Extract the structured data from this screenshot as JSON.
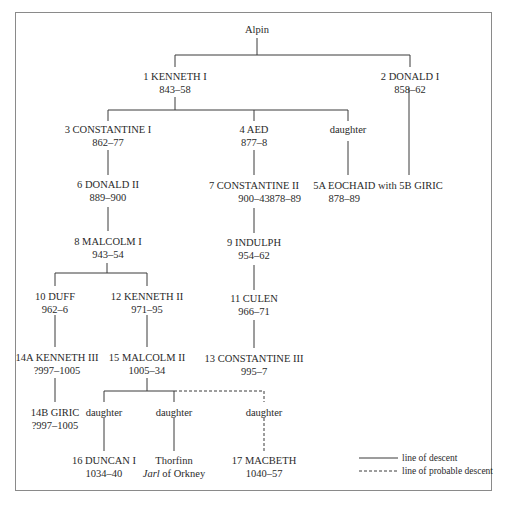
{
  "root": {
    "name": "Alpin"
  },
  "nodes": {
    "kenneth_i": {
      "name": "1 KENNETH I",
      "dates": "843–58"
    },
    "donald_i": {
      "name": "2 DONALD I",
      "dates": "858–62"
    },
    "constantine_i": {
      "name": "3 CONSTANTINE I",
      "dates": "862–77"
    },
    "aed": {
      "name": "4 AED",
      "dates": "877–8"
    },
    "daughter_kenneth": {
      "name": "daughter"
    },
    "donald_ii": {
      "name": "6 DONALD II",
      "dates": "889–900"
    },
    "constantine_ii": {
      "name": "7 CONSTANTINE II",
      "dates": "900–43"
    },
    "eochaid_giric": {
      "name": "5A EOCHAID with 5B GIRIC",
      "dates_eochaid": "878–89",
      "dates_giric": "878–89"
    },
    "malcolm_i": {
      "name": "8  MALCOLM I",
      "dates": "943–54"
    },
    "indulph": {
      "name": "9 INDULPH",
      "dates": "954–62"
    },
    "duff": {
      "name": "10 DUFF",
      "dates": "962–6"
    },
    "kenneth_ii": {
      "name": "12 KENNETH II",
      "dates": "971–95"
    },
    "culen": {
      "name": "11 CULEN",
      "dates": "966–71"
    },
    "kenneth_iii": {
      "name": "14A KENNETH III",
      "dates": "?997–1005"
    },
    "malcolm_ii": {
      "name": "15 MALCOLM II",
      "dates": "1005–34"
    },
    "constantine_iii": {
      "name": "13 CONSTANTINE III",
      "dates": "995–7"
    },
    "giric_14b": {
      "name": "14B GIRIC",
      "dates": "?997–1005"
    },
    "daughter_1": {
      "name": "daughter"
    },
    "daughter_2": {
      "name": "daughter"
    },
    "daughter_3": {
      "name": "daughter"
    },
    "duncan_i": {
      "name": "16 DUNCAN I",
      "dates": "1034–40"
    },
    "thorfinn": {
      "name": "Thorfinn",
      "title_italic": "Jarl",
      "title_rest": " of Orkney"
    },
    "macbeth": {
      "name": "17 MACBETH",
      "dates": "1040–57"
    }
  },
  "legend": {
    "solid_label": "line of descent",
    "dashed_label": "line of probable descent"
  },
  "colors": {
    "line": "#3a3a3a",
    "frame": "#8a8a8a",
    "text": "#2a2a2a"
  }
}
